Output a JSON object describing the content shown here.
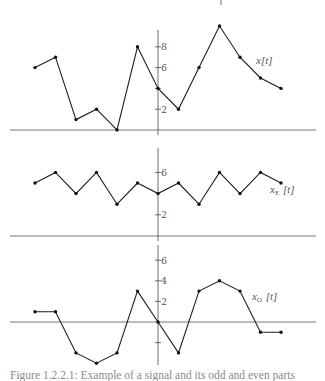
{
  "figure": {
    "caption": "Figure 1.2.2.1: Example of a signal and its odd and even parts"
  },
  "chart_data": [
    {
      "type": "line",
      "title": "",
      "series_label": "x[t]",
      "label_main": "x",
      "label_sub": "",
      "label_arg": "[t]",
      "x": [
        -6,
        -5,
        -4,
        -3,
        -2,
        -1,
        0,
        1,
        2,
        3,
        4,
        5,
        6
      ],
      "values": [
        6,
        7,
        1,
        2,
        0,
        8,
        4,
        2,
        6,
        10,
        7,
        5,
        4
      ],
      "yticks": [
        2,
        4,
        6,
        8
      ],
      "ytick_labels": [
        "2",
        "",
        "6",
        "8"
      ],
      "xlabel": "",
      "ylabel": "",
      "grid": false,
      "markers": true
    },
    {
      "type": "line",
      "title": "",
      "series_label": "xE[t]",
      "label_main": "x",
      "label_sub": "E",
      "label_arg": "[t]",
      "x": [
        -6,
        -5,
        -4,
        -3,
        -2,
        -1,
        0,
        1,
        2,
        3,
        4,
        5,
        6
      ],
      "values": [
        5,
        6,
        4,
        6,
        3,
        5,
        4,
        5,
        3,
        6,
        4,
        6,
        5
      ],
      "yticks": [
        2,
        6
      ],
      "ytick_labels": [
        "2",
        "6"
      ],
      "xlabel": "",
      "ylabel": "",
      "grid": false,
      "markers": true
    },
    {
      "type": "line",
      "title": "",
      "series_label": "xO[t]",
      "label_main": "x",
      "label_sub": "O",
      "label_arg": "[t]",
      "x": [
        -6,
        -5,
        -4,
        -3,
        -2,
        -1,
        0,
        1,
        2,
        3,
        4,
        5,
        6
      ],
      "values": [
        1,
        1,
        -3,
        -4,
        -3,
        3,
        0,
        -3,
        3,
        4,
        3,
        -1,
        -1
      ],
      "yticks": [
        -2,
        2,
        4,
        6
      ],
      "ytick_labels": [
        "",
        "2",
        "4",
        "6"
      ],
      "xlabel": "",
      "ylabel": "",
      "grid": false,
      "markers": true
    }
  ]
}
